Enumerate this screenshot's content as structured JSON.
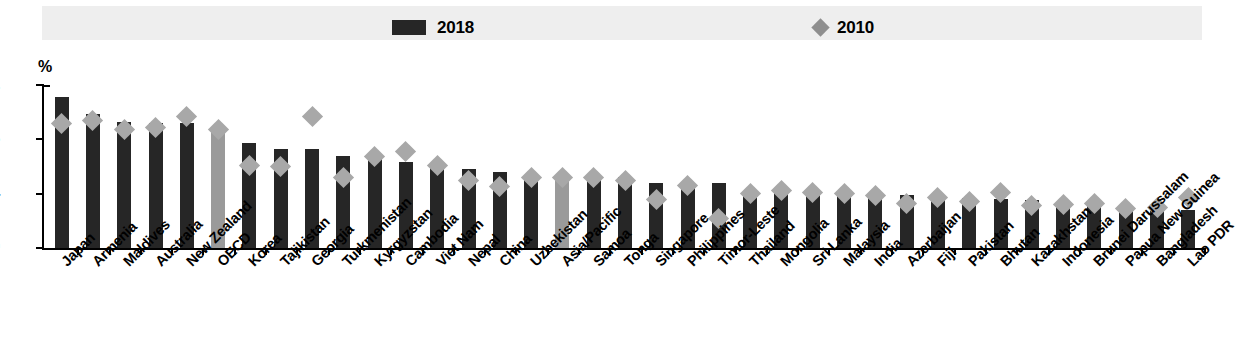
{
  "figure": {
    "y_axis_unit": "%",
    "legend": [
      {
        "label": "2018",
        "marker": "bar-swatch",
        "color": "#262626"
      },
      {
        "label": "2010",
        "marker": "diamond-swatch",
        "color": "#8e8e8e"
      }
    ]
  },
  "chart_data": {
    "type": "bar",
    "title": "",
    "subtitle": "",
    "xlabel": "",
    "ylabel": "%",
    "ylim": [
      0,
      12
    ],
    "yticks": [
      0,
      4,
      8,
      12
    ],
    "ytick_labels": [
      "0",
      "4",
      "8",
      "12"
    ],
    "grid": false,
    "legend_position": "top",
    "highlight_categories": [
      "OECD",
      "Asia/Pacific"
    ],
    "highlight_color": "#9a9a9a",
    "bar_color": "#262626",
    "marker_color": "#a8a8a8",
    "categories": [
      "Japan",
      "Armenia",
      "Maldives",
      "Australia",
      "New Zealand",
      "OECD",
      "Korea",
      "Tajikistan",
      "Georgia",
      "Turkmenistan",
      "Kyrgyzstan",
      "Cambodia",
      "Viet Nam",
      "Nepal",
      "China",
      "Uzbekistan",
      "Asia/Pacific",
      "Samoa",
      "Tonga",
      "Singapore",
      "Philippines",
      "Timor-Leste",
      "Thailand",
      "Mongolia",
      "Sri Lanka",
      "Malaysia",
      "India",
      "Azerbaijan",
      "Fiji",
      "Pakistan",
      "Bhutan",
      "Kazakhstan",
      "Indonesia",
      "Brunei Darussalam",
      "Papua New Guinea",
      "Bangladesh",
      "Lao PDR"
    ],
    "series": [
      {
        "name": "2018",
        "type": "bar",
        "values": [
          11.1,
          9.9,
          9.3,
          9.2,
          9.2,
          8.8,
          7.7,
          7.3,
          7.3,
          6.8,
          6.8,
          6.3,
          6.2,
          5.8,
          5.6,
          5.4,
          5.4,
          5.4,
          5.2,
          4.8,
          4.7,
          4.8,
          4.1,
          4.1,
          4.1,
          4.0,
          4.0,
          3.9,
          3.8,
          3.7,
          3.6,
          3.5,
          3.4,
          3.2,
          3.1,
          2.9,
          2.8
        ]
      },
      {
        "name": "2010",
        "type": "scatter",
        "marker": "diamond",
        "values": [
          9.2,
          9.4,
          8.7,
          8.9,
          9.7,
          8.7,
          6.1,
          6.0,
          9.7,
          5.2,
          6.7,
          7.1,
          6.1,
          5.0,
          4.5,
          5.2,
          5.2,
          5.2,
          5.0,
          3.6,
          4.6,
          2.2,
          4.0,
          4.2,
          4.1,
          4.0,
          3.9,
          3.3,
          3.7,
          3.4,
          4.1,
          3.1,
          3.2,
          3.3,
          2.9,
          3.0,
          3.7
        ]
      }
    ]
  }
}
